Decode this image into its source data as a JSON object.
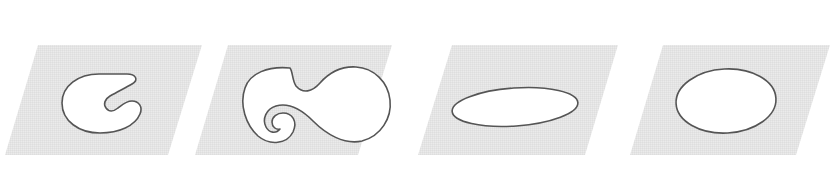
{
  "figure": {
    "title": "",
    "caption": "",
    "background_color": "#ffffff",
    "plane_fill_color": "#e4e4e4",
    "plane_edge_color": "#e4e4e4",
    "shape_fill_color": "#ffffff",
    "shape_outline_color": "#555555",
    "shape_outline_width": "1.6",
    "panel_count": "4"
  },
  "panels": [
    {
      "index": "1",
      "name": "panel-1",
      "plane_label": "",
      "shape_name": "kidney-c-shape-region",
      "shape_kind": "non-convex-blob",
      "shape_description": "C-shaped kidney blob with a deep concave notch opening to the right",
      "plane_points": "38,45 202,45 168,155 5,155",
      "shape_path": "M 99 74 C 78 74 62 86 62 103 C 62 121 79 133 100 133 C 119 133 135 126 140 114 C 143 107 139 101 132 101 C 126 101 122 105 118 108 C 113 112 109 112 106 108 C 103 104 105 99 110 96 C 119 91 127 87 132 84 C 139 80 136 74 127 74 Z",
      "shape_bbox": "62,74,79,59"
    },
    {
      "index": "2",
      "name": "panel-2",
      "plane_label": "",
      "shape_name": "dumbbell-spiral-region",
      "shape_kind": "non-convex-blob",
      "shape_description": "Dumbbell / S-curved blob with an inward spiral hook at the lower left lobe",
      "plane_points": "228,45 392,45 358,155 195,155",
      "shape_path": "M 290 68 C 268 66 250 73 245 88 C 239 105 246 125 258 136 C 270 146 287 144 293 132 C 298 121 292 113 283 113 C 277 113 272 117 272 122 C 272 127 276 130 280 129 C 276 134 269 133 266 127 C 262 119 266 109 276 106 C 290 102 303 111 313 121 C 326 134 344 145 362 141 C 381 136 392 118 390 100 C 388 82 374 68 356 67 C 340 66 328 74 320 83 C 312 92 303 94 296 86 C 292 80 293 72 290 68 Z",
      "shape_bbox": "243,66,149,79"
    },
    {
      "index": "3",
      "name": "panel-3",
      "plane_label": "",
      "shape_name": "flat-ellipse-region",
      "shape_kind": "convex-ellipse",
      "shape_description": "Flat wide ellipse, strongly eccentric, nearly edge-on",
      "plane_points": "452,45 618,45 585,155 418,155",
      "ellipse_cx": "515",
      "ellipse_cy": "107",
      "ellipse_rx": "63",
      "ellipse_ry": "19",
      "ellipse_rotation": "-4",
      "shape_bbox": "452,88,126,38"
    },
    {
      "index": "4",
      "name": "panel-4",
      "plane_label": "",
      "shape_name": "round-ellipse-region",
      "shape_kind": "convex-ellipse",
      "shape_description": "Near-circular ellipse, slightly wider than tall",
      "plane_points": "663,45 830,45 796,155 630,155",
      "ellipse_cx": "726",
      "ellipse_cy": "101",
      "ellipse_rx": "50",
      "ellipse_ry": "32",
      "ellipse_rotation": "-3",
      "shape_bbox": "676,69,100,64"
    }
  ]
}
